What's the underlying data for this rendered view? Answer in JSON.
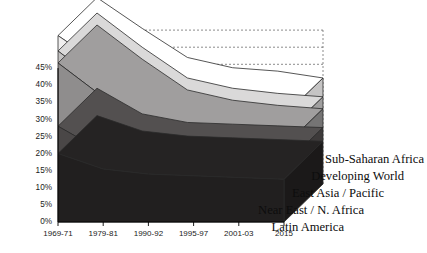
{
  "chart_data": {
    "type": "area",
    "stacked": true,
    "projection": "3d",
    "title": "",
    "subtitle": "",
    "xlabel": "",
    "ylabel": "",
    "categories": [
      "1969-71",
      "1979-81",
      "1990-92",
      "1995-97",
      "2001-03",
      "2015"
    ],
    "ylim": [
      0,
      45
    ],
    "ytick_values": [
      0,
      5,
      10,
      15,
      20,
      25,
      30,
      35,
      40,
      45
    ],
    "ytick_labels": [
      "0%",
      "5%",
      "10%",
      "15%",
      "20%",
      "25%",
      "30%",
      "35%",
      "40%",
      "45%"
    ],
    "grid": true,
    "grid_style": "dashed",
    "legend_position": "right-staggered",
    "series": [
      {
        "name": "Latin America",
        "color": "#211f1f",
        "values": [
          20,
          15.5,
          14,
          13.5,
          13,
          12.5
        ]
      },
      {
        "name": "Near East / N. Africa",
        "color": "#4a4747",
        "values": [
          8,
          5,
          4,
          4,
          4,
          4
        ]
      },
      {
        "name": "East Asia / Pacific",
        "color": "#8f8d8d",
        "values": [
          18.5,
          16,
          9.5,
          7,
          6,
          5.5
        ]
      },
      {
        "name": "Developing World",
        "color": "#c3c2c2",
        "values": [
          3.5,
          3.5,
          3.5,
          3.5,
          3.5,
          3.5
        ]
      },
      {
        "name": "Sub-Saharan Africa",
        "color": "#f0efef",
        "values": [
          4.5,
          5.5,
          6,
          6,
          6.5,
          5.5
        ]
      }
    ]
  },
  "axes": {
    "y_axis_name": "percent-axis",
    "x_axis_name": "period-axis"
  }
}
